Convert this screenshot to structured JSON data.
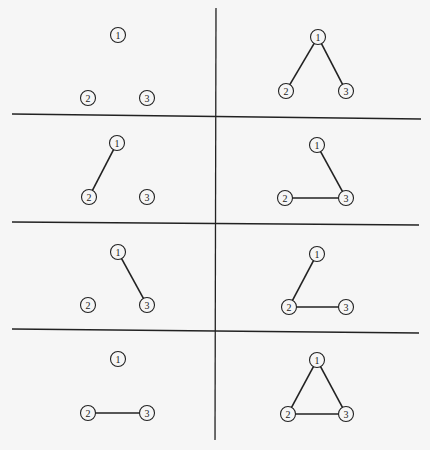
{
  "diagram": {
    "title": "",
    "background": "#f6f6f6",
    "line_color": "#222222",
    "grid_lines": {
      "vertical": {
        "x1": 216,
        "y1": 8,
        "x2": 215,
        "y2": 440
      },
      "horizontal": [
        {
          "x1": 12,
          "y1": 114,
          "x2": 421,
          "y2": 119
        },
        {
          "x1": 12,
          "y1": 222,
          "x2": 419,
          "y2": 225
        },
        {
          "x1": 12,
          "y1": 329,
          "x2": 419,
          "y2": 333
        }
      ]
    },
    "node_radius": 7.5,
    "panels": [
      {
        "id": "panel-1",
        "nodes": [
          {
            "label": "1",
            "x": 118,
            "y": 35
          },
          {
            "label": "2",
            "x": 88,
            "y": 98
          },
          {
            "label": "3",
            "x": 147,
            "y": 98
          }
        ],
        "edges": []
      },
      {
        "id": "panel-2",
        "nodes": [
          {
            "label": "1",
            "x": 318,
            "y": 37
          },
          {
            "label": "2",
            "x": 286,
            "y": 91
          },
          {
            "label": "3",
            "x": 346,
            "y": 91
          }
        ],
        "edges": [
          [
            "1",
            "2"
          ],
          [
            "1",
            "3"
          ]
        ]
      },
      {
        "id": "panel-3",
        "nodes": [
          {
            "label": "1",
            "x": 117,
            "y": 143
          },
          {
            "label": "2",
            "x": 89,
            "y": 197
          },
          {
            "label": "3",
            "x": 147,
            "y": 197
          }
        ],
        "edges": [
          [
            "1",
            "2"
          ]
        ]
      },
      {
        "id": "panel-4",
        "nodes": [
          {
            "label": "1",
            "x": 317,
            "y": 145
          },
          {
            "label": "2",
            "x": 285,
            "y": 198
          },
          {
            "label": "3",
            "x": 346,
            "y": 198
          }
        ],
        "edges": [
          [
            "1",
            "3"
          ],
          [
            "2",
            "3"
          ]
        ]
      },
      {
        "id": "panel-5",
        "nodes": [
          {
            "label": "1",
            "x": 118,
            "y": 252
          },
          {
            "label": "2",
            "x": 88,
            "y": 305
          },
          {
            "label": "3",
            "x": 147,
            "y": 305
          }
        ],
        "edges": [
          [
            "1",
            "3"
          ]
        ]
      },
      {
        "id": "panel-6",
        "nodes": [
          {
            "label": "1",
            "x": 317,
            "y": 254
          },
          {
            "label": "2",
            "x": 289,
            "y": 307
          },
          {
            "label": "3",
            "x": 346,
            "y": 307
          }
        ],
        "edges": [
          [
            "1",
            "2"
          ],
          [
            "2",
            "3"
          ]
        ]
      },
      {
        "id": "panel-7",
        "nodes": [
          {
            "label": "1",
            "x": 118,
            "y": 359
          },
          {
            "label": "2",
            "x": 88,
            "y": 413
          },
          {
            "label": "3",
            "x": 147,
            "y": 413
          }
        ],
        "edges": [
          [
            "2",
            "3"
          ]
        ]
      },
      {
        "id": "panel-8",
        "nodes": [
          {
            "label": "1",
            "x": 317,
            "y": 360
          },
          {
            "label": "2",
            "x": 288,
            "y": 414
          },
          {
            "label": "3",
            "x": 346,
            "y": 414
          }
        ],
        "edges": [
          [
            "1",
            "2"
          ],
          [
            "1",
            "3"
          ],
          [
            "2",
            "3"
          ]
        ]
      }
    ]
  }
}
